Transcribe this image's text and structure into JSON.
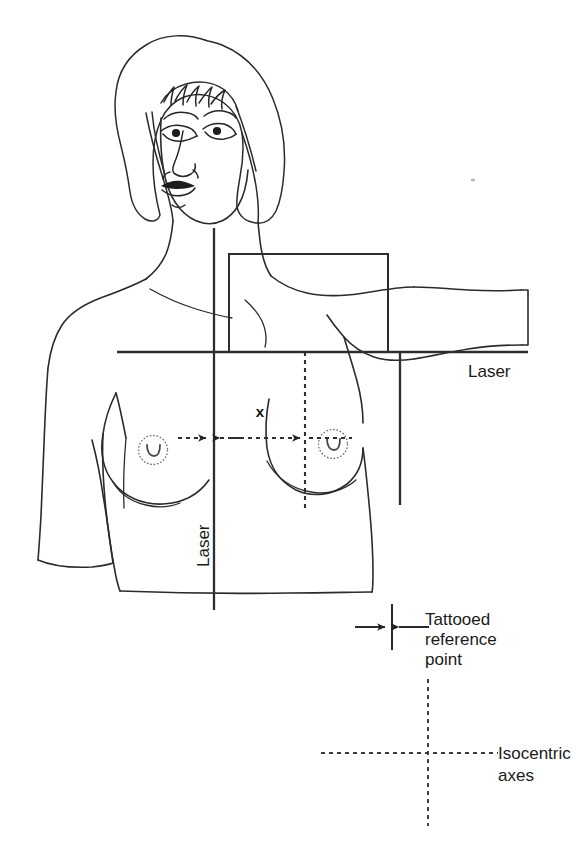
{
  "figure": {
    "background_color": "#ffffff",
    "line_color": "#2b2b2b",
    "width": 584,
    "height": 851
  },
  "labels": {
    "laser_horizontal": "Laser",
    "laser_vertical": "Laser",
    "dimension_x": "x",
    "tattooed_reference_line1": "Tattooed",
    "tattooed_reference_line2": "reference",
    "tattooed_reference_line3": "point",
    "isocentric_line1": "Isocentric",
    "isocentric_line2": "axes"
  },
  "legend": {
    "items": [
      {
        "name": "tattooed-reference-point",
        "label": "Tattooed reference point",
        "marker": "inward-arrows-with-tick"
      },
      {
        "name": "isocentric-axes",
        "label": "Isocentric axes",
        "marker": "dashed-crosshair"
      }
    ]
  },
  "annotations": {
    "laser_horizontal_note": "Horizontal laser line across chest",
    "laser_vertical_note": "Vertical laser line down sternum",
    "field_rect_note": "Rectangular treatment field outline",
    "dimension_note": "Separation x between vertical laser and isocentre axis"
  },
  "geometry": {
    "laser_horizontal_y": 352,
    "laser_vertical_x": 214,
    "laser_right_vertical_x": 400,
    "field_rect": {
      "x": 229,
      "y": 254,
      "width": 159,
      "height": 98
    },
    "dashed_vertical_x": 305,
    "dimension_arrow_y": 438,
    "isocentre_cross": {
      "x": 428,
      "y": 753
    },
    "tattoo_tick": {
      "x": 392,
      "y_top": 604,
      "y_bottom": 650
    }
  }
}
